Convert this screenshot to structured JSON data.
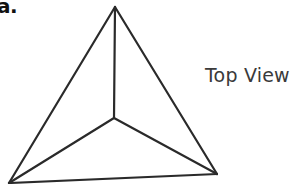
{
  "figure": {
    "part_label": "a.",
    "caption": "Top View",
    "background_color": "#ffffff",
    "stroke_color": "#2a2a2a",
    "stroke_width": 2.2,
    "label_color": "#111111",
    "caption_color": "#3a3a3a",
    "width": 307,
    "height": 184,
    "shape_name": "tetrahedron-top-view",
    "vertices": {
      "apex": {
        "x": 115,
        "y": 7
      },
      "left": {
        "x": 9,
        "y": 183
      },
      "right": {
        "x": 217,
        "y": 174
      },
      "center": {
        "x": 114,
        "y": 118
      }
    },
    "edges": [
      {
        "name": "outer-edge-apex-to-left",
        "from": "apex",
        "to": "left"
      },
      {
        "name": "outer-edge-apex-to-right",
        "from": "apex",
        "to": "right"
      },
      {
        "name": "outer-edge-left-to-right",
        "from": "left",
        "to": "right"
      },
      {
        "name": "inner-spoke-apex-to-center",
        "from": "apex",
        "to": "center"
      },
      {
        "name": "inner-spoke-left-to-center",
        "from": "left",
        "to": "center"
      },
      {
        "name": "inner-spoke-right-to-center",
        "from": "right",
        "to": "center"
      }
    ]
  }
}
